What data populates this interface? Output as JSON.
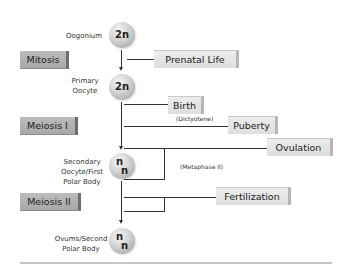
{
  "stages": [
    {
      "label_lines": [
        "Oogonium"
      ],
      "ploidy": "2n"
    },
    {
      "label_lines": [
        "Primary",
        "Oocyte"
      ],
      "ploidy": "2n"
    },
    {
      "label_lines": [
        "Secondary",
        "Oocyte/First",
        "Polar Body"
      ],
      "ploidy": [
        "n",
        "n"
      ]
    },
    {
      "label_lines": [
        "Ovums/Second",
        "Polar Body"
      ],
      "ploidy": [
        "n",
        "n"
      ]
    }
  ],
  "phases": [
    {
      "label": "Mitosis"
    },
    {
      "label": "Meiosis I"
    },
    {
      "label": "Meiosis II"
    }
  ],
  "events": [
    {
      "label": "Prenatal Life"
    },
    {
      "label": "Birth"
    },
    {
      "label": "Puberty"
    },
    {
      "label": "Ovulation"
    },
    {
      "label": "Fertilization"
    }
  ],
  "notes": [
    {
      "text": "(Dictyotene)"
    },
    {
      "text": "(Metaphase II)"
    }
  ],
  "colors": {
    "phase_box": "#b0b0b0",
    "event_box": "#e4e4e4",
    "line": "#333333",
    "rule": "#c8c8c8"
  }
}
